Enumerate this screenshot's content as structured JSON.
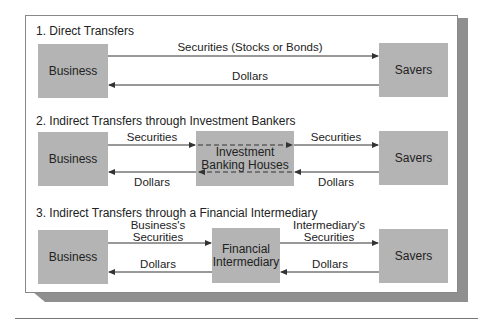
{
  "sections": [
    {
      "title": "1. Direct Transfers",
      "left_box": "Business",
      "right_box": "Savers",
      "top_label": "Securities (Stocks or Bonds)",
      "bottom_label": "Dollars"
    },
    {
      "title": "2. Indirect Transfers through Investment Bankers",
      "left_box": "Business",
      "middle_box": "Investment Banking Houses",
      "right_box": "Savers",
      "top_left_label": "Securities",
      "top_right_label": "Securities",
      "bottom_left_label": "Dollars",
      "bottom_right_label": "Dollars"
    },
    {
      "title": "3. Indirect Transfers through a Financial Intermediary",
      "left_box": "Business",
      "middle_box_line1": "Financial",
      "middle_box_line2": "Intermediary",
      "right_box": "Savers",
      "top_left_label_line1": "Business's",
      "top_left_label_line2": "Securities",
      "top_right_label_line1": "Intermediary's",
      "top_right_label_line2": "Securities",
      "bottom_left_label": "Dollars",
      "bottom_right_label": "Dollars"
    }
  ],
  "colors": {
    "box_fill": "#b4b4b4",
    "shadow": "#8f8f8f",
    "line": "#333333"
  }
}
